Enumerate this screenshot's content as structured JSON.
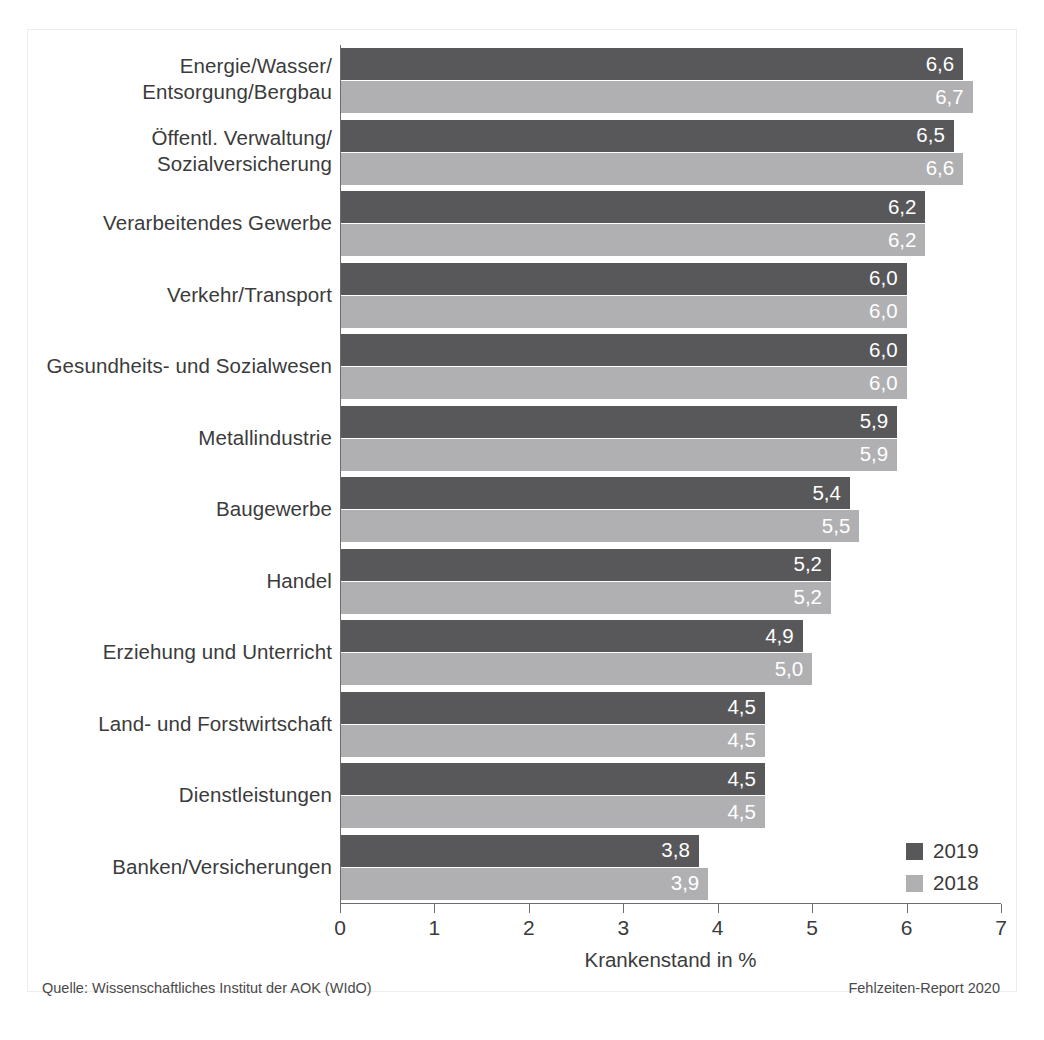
{
  "chart_data": {
    "type": "bar",
    "orientation": "horizontal",
    "title": "",
    "xlabel": "Krankenstand in %",
    "ylabel": "",
    "xlim": [
      0,
      7
    ],
    "xticks": [
      "0",
      "1",
      "2",
      "3",
      "4",
      "5",
      "6",
      "7"
    ],
    "grid": false,
    "legend_position": "bottom-right",
    "categories": [
      "Energie/Wasser/\nEntsorgung/Bergbau",
      "Öffentl. Verwaltung/\nSozialversicherung",
      "Verarbeitendes Gewerbe",
      "Verkehr/Transport",
      "Gesundheits- und Sozialwesen",
      "Metallindustrie",
      "Baugewerbe",
      "Handel",
      "Erziehung und Unterricht",
      "Land- und Forstwirtschaft",
      "Dienstleistungen",
      "Banken/Versicherungen"
    ],
    "series": [
      {
        "name": "2019",
        "color": "#58585a",
        "values": [
          6.6,
          6.5,
          6.2,
          6.0,
          6.0,
          5.9,
          5.4,
          5.2,
          4.9,
          4.5,
          4.5,
          3.8
        ],
        "labels": [
          "6,6",
          "6,5",
          "6,2",
          "6,0",
          "6,0",
          "5,9",
          "5,4",
          "5,2",
          "4,9",
          "4,5",
          "4,5",
          "3,8"
        ]
      },
      {
        "name": "2018",
        "color": "#b0b0b2",
        "values": [
          6.7,
          6.6,
          6.2,
          6.0,
          6.0,
          5.9,
          5.5,
          5.2,
          5.0,
          4.5,
          4.5,
          3.9
        ],
        "labels": [
          "6,7",
          "6,6",
          "6,2",
          "6,0",
          "6,0",
          "5,9",
          "5,5",
          "5,2",
          "5,0",
          "4,5",
          "4,5",
          "3,9"
        ]
      }
    ]
  },
  "legend": {
    "items": [
      {
        "label": "2019",
        "color": "#58585a"
      },
      {
        "label": "2018",
        "color": "#b0b0b2"
      }
    ]
  },
  "axis": {
    "x_title": "Krankenstand in %",
    "ticks": [
      "0",
      "1",
      "2",
      "3",
      "4",
      "5",
      "6",
      "7"
    ]
  },
  "footer": {
    "source": "Quelle: Wissenschaftliches Institut der AOK (WIdO)",
    "report": "Fehlzeiten-Report 2020"
  },
  "colors": {
    "series_2019": "#58585a",
    "series_2018": "#b0b0b2",
    "axis": "#6d6d6d",
    "text": "#3b3b3b",
    "background": "#ffffff"
  }
}
